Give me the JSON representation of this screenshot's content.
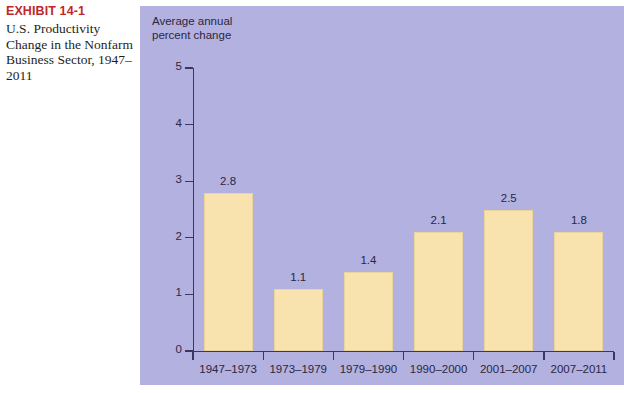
{
  "exhibit": {
    "number": "EXHIBIT 14-1",
    "caption": "U.S. Productivity Change in the Nonfarm Business Sector, 1947–2011",
    "number_color": "#C0272D"
  },
  "panel": {
    "background_color": "#b2b1e0",
    "bar_color": "#f8e3ae",
    "axis_color": "#3b3760"
  },
  "chart_data": {
    "type": "bar",
    "title": "",
    "axis_title": "Average annual\npercent change",
    "xlabel": "",
    "ylabel": "Average annual percent change",
    "categories": [
      "1947–1973",
      "1973–1979",
      "1979–1990",
      "1990–2000",
      "2001–2007",
      "2007–2011"
    ],
    "values": [
      2.8,
      1.1,
      1.4,
      2.1,
      2.5,
      1.8
    ],
    "value_labels": [
      "2.8",
      "1.1",
      "1.4",
      "2.1",
      "2.5",
      "1.8"
    ],
    "drawn_heights": [
      2.8,
      1.1,
      1.4,
      2.1,
      2.5,
      2.1
    ],
    "ylim": [
      0,
      5
    ],
    "yticks": [
      0,
      1,
      2,
      3,
      4,
      5
    ],
    "ytick_labels": [
      "0",
      "1",
      "2",
      "3",
      "4",
      "5"
    ],
    "grid": false,
    "legend": false
  }
}
